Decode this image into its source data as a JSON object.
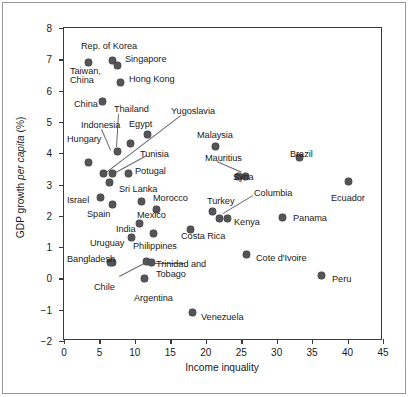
{
  "figure": {
    "point_color": "#555558",
    "frame_color": "#3a3a3a",
    "background": "#ffffff"
  },
  "chart_data": {
    "type": "scatter",
    "title": "",
    "xlabel": "Income inquality",
    "ylabel_prefix": "GDP growth ",
    "ylabel_italic": "per capita",
    "ylabel_suffix": " (%)",
    "xlim": [
      0,
      45
    ],
    "ylim": [
      -2,
      8
    ],
    "xticks": [
      0,
      5,
      10,
      15,
      20,
      25,
      30,
      35,
      40,
      45
    ],
    "yticks": [
      -2,
      -1,
      0,
      1,
      2,
      3,
      4,
      5,
      6,
      7,
      8
    ],
    "grid": false,
    "legend": "none",
    "points": [
      {
        "label": "Rep. of Korea",
        "x": 6.8,
        "y": 6.95
      },
      {
        "label": "Singapore",
        "x": 7.5,
        "y": 6.8
      },
      {
        "label": "Taiwan, China",
        "x": 3.5,
        "y": 6.9
      },
      {
        "label": "Hong Kong",
        "x": 7.9,
        "y": 6.25
      },
      {
        "label": "China",
        "x": 5.4,
        "y": 5.65
      },
      {
        "label": "Thailand",
        "x": 9.4,
        "y": 4.3
      },
      {
        "label": "Egypt",
        "x": 11.8,
        "y": 4.6
      },
      {
        "label": "Indonesia",
        "x": 7.5,
        "y": 4.05
      },
      {
        "label": "Hungary",
        "x": 3.4,
        "y": 3.7
      },
      {
        "label": "Yugoslavia",
        "x": 5.6,
        "y": 3.35
      },
      {
        "label": "Tunisia",
        "x": 6.9,
        "y": 3.35
      },
      {
        "label": "Potugal",
        "x": 9.1,
        "y": 3.35
      },
      {
        "label": "Sri Lanka",
        "x": 6.4,
        "y": 3.05
      },
      {
        "label": "Malaysia",
        "x": 21.4,
        "y": 4.2
      },
      {
        "label": "Mauritius",
        "x": 24.6,
        "y": 3.25
      },
      {
        "label": "Syria",
        "x": 25.6,
        "y": 3.25
      },
      {
        "label": "Israel",
        "x": 5.1,
        "y": 2.6
      },
      {
        "label": "Spain",
        "x": 6.9,
        "y": 2.35
      },
      {
        "label": "Morocco",
        "x": 11.0,
        "y": 2.45
      },
      {
        "label": "Mexico",
        "x": 13.0,
        "y": 2.2
      },
      {
        "label": "India",
        "x": 10.6,
        "y": 1.75
      },
      {
        "label": "Costa Rica",
        "x": 17.8,
        "y": 1.55
      },
      {
        "label": "Philippines",
        "x": 12.6,
        "y": 1.45
      },
      {
        "label": "Uruguay",
        "x": 9.5,
        "y": 1.3
      },
      {
        "label": "Bangladesh",
        "x": 6.9,
        "y": 0.5
      },
      {
        "label": "Trinidad and Tobago",
        "x": 11.7,
        "y": 0.55
      },
      {
        "label": "Trinidad and Tobago 2",
        "x": 12.3,
        "y": 0.5
      },
      {
        "label": "Chile",
        "x": 6.5,
        "y": 0.5
      },
      {
        "label": "Argentina",
        "x": 11.4,
        "y": 0.0
      },
      {
        "label": "Turkey",
        "x": 21.0,
        "y": 2.15
      },
      {
        "label": "Kenya",
        "x": 22.0,
        "y": 1.9
      },
      {
        "label": "Columbia",
        "x": 23.0,
        "y": 1.9
      },
      {
        "label": "Panama",
        "x": 30.8,
        "y": 1.95
      },
      {
        "label": "Brazil",
        "x": 33.2,
        "y": 3.85
      },
      {
        "label": "Ecuador",
        "x": 40.1,
        "y": 3.1
      },
      {
        "label": "Cote d'Ivoire",
        "x": 25.7,
        "y": 0.75
      },
      {
        "label": "Peru",
        "x": 36.3,
        "y": 0.1
      },
      {
        "label": "Venezuela",
        "x": 18.1,
        "y": -1.1
      }
    ],
    "annotations": [
      {
        "text": "Rep. of Korea",
        "x": 80,
        "y": 40
      },
      {
        "text": "Singapore",
        "x": 124,
        "y": 53
      },
      {
        "text": "Taiwan,",
        "x": 69,
        "y": 65
      },
      {
        "text": "China",
        "x": 69,
        "y": 74
      },
      {
        "text": "Hong Kong",
        "x": 128,
        "y": 73
      },
      {
        "text": "China",
        "x": 73,
        "y": 98
      },
      {
        "text": "Thailand",
        "x": 113,
        "y": 103
      },
      {
        "text": "Yugoslavia",
        "x": 170,
        "y": 105
      },
      {
        "text": "Indonesia",
        "x": 80,
        "y": 119
      },
      {
        "text": "Egypt",
        "x": 128,
        "y": 118
      },
      {
        "text": "Malaysia",
        "x": 196,
        "y": 129
      },
      {
        "text": "Hungary",
        "x": 66,
        "y": 133
      },
      {
        "text": "Tunisia",
        "x": 139,
        "y": 148
      },
      {
        "text": "Mauritius",
        "x": 204,
        "y": 152
      },
      {
        "text": "Potugal",
        "x": 134,
        "y": 165
      },
      {
        "text": "Syria",
        "x": 232,
        "y": 171
      },
      {
        "text": "Sri Lanka",
        "x": 118,
        "y": 183
      },
      {
        "text": "Morocco",
        "x": 152,
        "y": 192
      },
      {
        "text": "Turkey",
        "x": 206,
        "y": 195
      },
      {
        "text": "Columbia",
        "x": 253,
        "y": 187
      },
      {
        "text": "Israel",
        "x": 66,
        "y": 194
      },
      {
        "text": "Spain",
        "x": 86,
        "y": 208
      },
      {
        "text": "Mexico",
        "x": 136,
        "y": 209
      },
      {
        "text": "Panama",
        "x": 292,
        "y": 212
      },
      {
        "text": "Kenya",
        "x": 233,
        "y": 216
      },
      {
        "text": "India",
        "x": 115,
        "y": 223
      },
      {
        "text": "Costa Rica",
        "x": 180,
        "y": 230
      },
      {
        "text": "Uruguay",
        "x": 89,
        "y": 237
      },
      {
        "text": "Philippines",
        "x": 132,
        "y": 240
      },
      {
        "text": "Brazil",
        "x": 289,
        "y": 148
      },
      {
        "text": "Ecuador",
        "x": 330,
        "y": 192
      },
      {
        "text": "Bangladesh",
        "x": 66,
        "y": 253
      },
      {
        "text": "Cote d'Ivoire",
        "x": 255,
        "y": 252
      },
      {
        "text": "Trinidad and",
        "x": 155,
        "y": 258
      },
      {
        "text": "Tobago",
        "x": 155,
        "y": 268
      },
      {
        "text": "Peru",
        "x": 331,
        "y": 273
      },
      {
        "text": "Chile",
        "x": 93,
        "y": 281
      },
      {
        "text": "Argentina",
        "x": 133,
        "y": 292
      },
      {
        "text": "Venezuela",
        "x": 200,
        "y": 311
      }
    ],
    "leaders": [
      {
        "from": [
          101,
          128
        ],
        "to": [
          110,
          149
        ]
      },
      {
        "from": [
          118,
          113
        ],
        "to": [
          116,
          146
        ]
      },
      {
        "from": [
          146,
          155
        ],
        "to": [
          113,
          173
        ]
      },
      {
        "from": [
          180,
          115
        ],
        "to": [
          104,
          173
        ]
      },
      {
        "from": [
          216,
          160
        ],
        "to": [
          241,
          171
        ]
      },
      {
        "from": [
          252,
          195
        ],
        "to": [
          222,
          213
        ]
      },
      {
        "from": [
          118,
          275
        ],
        "to": [
          143,
          262
        ]
      },
      {
        "from": [
          152,
          262
        ],
        "to": [
          184,
          262
        ]
      }
    ]
  }
}
